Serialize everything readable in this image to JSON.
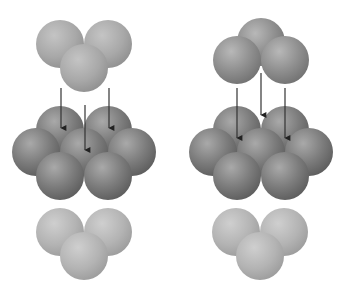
{
  "diagram": {
    "title": "Close packing of spheres: ABC (left) vs ABA (right) stacking",
    "colors": {
      "light_layer": "#a9a9a9",
      "light_layer_edge": "#8e8e8e",
      "top_layer_right": "#8d8d8d",
      "dark_layer": "#7a7a7a",
      "dark_layer_edge": "#5e5e5e",
      "arrow": "#333333",
      "background": "#ffffff"
    },
    "sphere_radius": 24,
    "panels": [
      {
        "name": "left",
        "top_layer": [
          [
            60,
            44,
            "light"
          ],
          [
            108,
            44,
            "light"
          ],
          [
            84,
            68,
            "light"
          ]
        ],
        "middle_layer": [
          [
            60,
            130
          ],
          [
            108,
            130
          ],
          [
            36,
            152
          ],
          [
            84,
            152
          ],
          [
            132,
            152
          ],
          [
            60,
            176
          ],
          [
            108,
            176
          ]
        ],
        "bottom_layer": [
          [
            60,
            232,
            "pale"
          ],
          [
            108,
            232,
            "pale"
          ],
          [
            84,
            256,
            "pale"
          ]
        ],
        "arrows": [
          {
            "x": 61,
            "y1": 88,
            "y2": 131
          },
          {
            "x": 85,
            "y1": 105,
            "y2": 153
          },
          {
            "x": 109,
            "y1": 88,
            "y2": 131
          }
        ]
      },
      {
        "name": "right",
        "top_layer": [
          [
            261,
            42,
            "mid"
          ],
          [
            237,
            60,
            "mid"
          ],
          [
            285,
            60,
            "mid"
          ]
        ],
        "middle_layer": [
          [
            237,
            130
          ],
          [
            285,
            130
          ],
          [
            213,
            152
          ],
          [
            261,
            152
          ],
          [
            309,
            152
          ],
          [
            237,
            176
          ],
          [
            285,
            176
          ]
        ],
        "bottom_layer": [
          [
            236,
            232,
            "pale"
          ],
          [
            284,
            232,
            "pale"
          ],
          [
            260,
            256,
            "pale"
          ]
        ],
        "arrows": [
          {
            "x": 237,
            "y1": 88,
            "y2": 141
          },
          {
            "x": 261,
            "y1": 73,
            "y2": 118
          },
          {
            "x": 285,
            "y1": 88,
            "y2": 141
          }
        ]
      }
    ]
  }
}
